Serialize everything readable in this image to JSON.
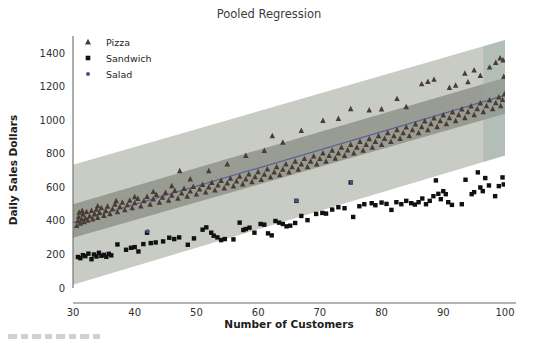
{
  "figure": {
    "caption_fragment": "FIGURE 1"
  },
  "chart_data": {
    "type": "scatter",
    "title": "Pooled Regression",
    "xlabel": "Number of Customers",
    "ylabel": "Daily Sales Dollars",
    "xlim": [
      30,
      100
    ],
    "ylim": [
      0,
      1480
    ],
    "xticks": [
      30,
      40,
      50,
      60,
      70,
      80,
      90,
      100
    ],
    "yticks": [
      0,
      200,
      400,
      600,
      800,
      1000,
      1200,
      1400
    ],
    "grid": false,
    "legend_position": "upper-left",
    "legend": [
      {
        "label": "Pizza",
        "marker": "triangle",
        "color": "#4a3c33"
      },
      {
        "label": "Sandwich",
        "marker": "square",
        "color": "#111111"
      },
      {
        "label": "Salad",
        "marker": "dot",
        "color": "#4a4f8c"
      }
    ],
    "regression_line": {
      "name": "Pooled fit",
      "color": "#5b5f99",
      "x": [
        30,
        100
      ],
      "y": [
        390,
        1150
      ],
      "slope": 10.86,
      "intercept": 64.3
    },
    "bands": [
      {
        "name": "prediction-interval",
        "color": "#9aa396",
        "opacity": 0.55,
        "x": [
          30,
          100
        ],
        "upper": [
          735,
          1480
        ],
        "lower": [
          20,
          790
        ]
      },
      {
        "name": "confidence-interval",
        "color": "#5e6157",
        "opacity": 0.45,
        "x": [
          30,
          100
        ],
        "upper": [
          500,
          1255
        ],
        "lower": [
          300,
          1040
        ]
      }
    ],
    "band_right_tint": {
      "name": "right-edge-tint",
      "color": "#93a7a4",
      "x_start": 96.5,
      "x_end": 100
    },
    "series": [
      {
        "name": "Pizza",
        "marker": "triangle",
        "color": "#4a3c33",
        "points": [
          [
            30.6,
            372
          ],
          [
            30.8,
            400
          ],
          [
            30.9,
            425
          ],
          [
            31.0,
            452
          ],
          [
            31.2,
            386
          ],
          [
            31.4,
            410
          ],
          [
            31.6,
            440
          ],
          [
            31.8,
            395
          ],
          [
            32.0,
            418
          ],
          [
            32.2,
            455
          ],
          [
            32.4,
            404
          ],
          [
            32.7,
            430
          ],
          [
            33.0,
            462
          ],
          [
            33.2,
            412
          ],
          [
            33.5,
            443
          ],
          [
            33.8,
            470
          ],
          [
            34.0,
            421
          ],
          [
            34.3,
            450
          ],
          [
            34.6,
            478
          ],
          [
            35.0,
            432
          ],
          [
            35.3,
            462
          ],
          [
            35.6,
            488
          ],
          [
            36.0,
            443
          ],
          [
            36.4,
            472
          ],
          [
            36.8,
            500
          ],
          [
            37.2,
            455
          ],
          [
            37.6,
            485
          ],
          [
            38.0,
            512
          ],
          [
            38.4,
            466
          ],
          [
            38.8,
            496
          ],
          [
            39.2,
            523
          ],
          [
            39.6,
            478
          ],
          [
            40.0,
            508
          ],
          [
            40.5,
            534
          ],
          [
            41.0,
            489
          ],
          [
            41.5,
            520
          ],
          [
            42.0,
            546
          ],
          [
            42.5,
            500
          ],
          [
            43.0,
            531
          ],
          [
            43.5,
            558
          ],
          [
            44.0,
            512
          ],
          [
            44.5,
            542
          ],
          [
            45.0,
            570
          ],
          [
            45.5,
            524
          ],
          [
            46.0,
            554
          ],
          [
            46.5,
            582
          ],
          [
            47.0,
            536
          ],
          [
            47.3,
            700
          ],
          [
            47.6,
            566
          ],
          [
            48.0,
            594
          ],
          [
            48.5,
            548
          ],
          [
            49.0,
            578
          ],
          [
            49.5,
            606
          ],
          [
            50.0,
            560
          ],
          [
            50.5,
            590
          ],
          [
            51.0,
            618
          ],
          [
            51.5,
            572
          ],
          [
            52.0,
            602
          ],
          [
            52.5,
            630
          ],
          [
            53.0,
            584
          ],
          [
            53.5,
            614
          ],
          [
            54.0,
            642
          ],
          [
            54.5,
            596
          ],
          [
            55.0,
            626
          ],
          [
            55.5,
            654
          ],
          [
            56.0,
            608
          ],
          [
            56.5,
            638
          ],
          [
            57.0,
            666
          ],
          [
            57.5,
            620
          ],
          [
            58.0,
            650
          ],
          [
            58.5,
            680
          ],
          [
            59.0,
            634
          ],
          [
            59.5,
            664
          ],
          [
            60.0,
            694
          ],
          [
            60.5,
            648
          ],
          [
            61.0,
            678
          ],
          [
            61.5,
            710
          ],
          [
            62.0,
            662
          ],
          [
            62.3,
            908
          ],
          [
            62.6,
            692
          ],
          [
            63.0,
            724
          ],
          [
            63.5,
            676
          ],
          [
            64.0,
            708
          ],
          [
            64.5,
            740
          ],
          [
            65.0,
            692
          ],
          [
            65.5,
            724
          ],
          [
            66.0,
            756
          ],
          [
            66.5,
            708
          ],
          [
            67.0,
            740
          ],
          [
            67.5,
            772
          ],
          [
            68.0,
            724
          ],
          [
            68.5,
            756
          ],
          [
            69.0,
            788
          ],
          [
            69.5,
            740
          ],
          [
            70.0,
            772
          ],
          [
            70.5,
            806
          ],
          [
            71.0,
            756
          ],
          [
            71.5,
            790
          ],
          [
            72.0,
            822
          ],
          [
            72.5,
            774
          ],
          [
            73.0,
            806
          ],
          [
            73.5,
            840
          ],
          [
            74.0,
            790
          ],
          [
            74.5,
            824
          ],
          [
            75.0,
            856
          ],
          [
            75.5,
            806
          ],
          [
            76.0,
            840
          ],
          [
            76.5,
            874
          ],
          [
            77.0,
            822
          ],
          [
            77.5,
            856
          ],
          [
            78.0,
            890
          ],
          [
            78.5,
            840
          ],
          [
            79.0,
            874
          ],
          [
            79.5,
            908
          ],
          [
            80.0,
            856
          ],
          [
            80.5,
            892
          ],
          [
            81.0,
            926
          ],
          [
            81.5,
            874
          ],
          [
            82.0,
            908
          ],
          [
            82.5,
            944
          ],
          [
            83.0,
            892
          ],
          [
            83.5,
            926
          ],
          [
            84.0,
            960
          ],
          [
            84.5,
            908
          ],
          [
            85.0,
            944
          ],
          [
            85.5,
            978
          ],
          [
            86.0,
            926
          ],
          [
            86.5,
            962
          ],
          [
            87.0,
            996
          ],
          [
            87.5,
            944
          ],
          [
            88.0,
            980
          ],
          [
            88.5,
            1014
          ],
          [
            89.0,
            962
          ],
          [
            89.5,
            998
          ],
          [
            90.0,
            1032
          ],
          [
            90.5,
            980
          ],
          [
            91.0,
            1016
          ],
          [
            91.5,
            1050
          ],
          [
            92.0,
            998
          ],
          [
            92.5,
            1034
          ],
          [
            93.0,
            1068
          ],
          [
            93.5,
            1016
          ],
          [
            94.0,
            1052
          ],
          [
            94.5,
            1086
          ],
          [
            95.0,
            1034
          ],
          [
            95.5,
            1070
          ],
          [
            96.0,
            1104
          ],
          [
            96.5,
            1052
          ],
          [
            97.0,
            1088
          ],
          [
            97.5,
            1122
          ],
          [
            98.0,
            1070
          ],
          [
            98.5,
            1106
          ],
          [
            99.0,
            1140
          ],
          [
            99.3,
            1088
          ],
          [
            99.6,
            1124
          ],
          [
            99.9,
            1158
          ],
          [
            86.5,
            1218
          ],
          [
            87.5,
            1232
          ],
          [
            88.5,
            1245
          ],
          [
            93.5,
            1282
          ],
          [
            95.0,
            1300
          ],
          [
            96.0,
            1268
          ],
          [
            97.5,
            1318
          ],
          [
            98.5,
            1345
          ],
          [
            99.2,
            1372
          ],
          [
            99.7,
            1360
          ],
          [
            99.8,
            1262
          ],
          [
            91.0,
            1196
          ],
          [
            92.0,
            1210
          ],
          [
            94.0,
            1230
          ],
          [
            82.5,
            1130
          ],
          [
            84.0,
            1082
          ],
          [
            80.0,
            1068
          ],
          [
            78.0,
            1062
          ],
          [
            75.0,
            1070
          ],
          [
            70.5,
            1000
          ],
          [
            73.0,
            1012
          ],
          [
            67.0,
            940
          ],
          [
            64.0,
            870
          ],
          [
            61.0,
            820
          ],
          [
            58.0,
            790
          ],
          [
            55.0,
            740
          ],
          [
            52.0,
            700
          ],
          [
            49.0,
            650
          ],
          [
            46.0,
            610
          ],
          [
            43.0,
            575
          ],
          [
            40.0,
            545
          ],
          [
            37.0,
            520
          ],
          [
            34.0,
            490
          ],
          [
            31.5,
            462
          ]
        ]
      },
      {
        "name": "Sandwich",
        "marker": "square",
        "color": "#111111",
        "points": [
          [
            30.8,
            185
          ],
          [
            31.2,
            178
          ],
          [
            31.6,
            196
          ],
          [
            32.0,
            190
          ],
          [
            32.5,
            205
          ],
          [
            33.0,
            172
          ],
          [
            33.4,
            200
          ],
          [
            33.8,
            188
          ],
          [
            34.2,
            210
          ],
          [
            34.6,
            192
          ],
          [
            35.0,
            198
          ],
          [
            35.4,
            186
          ],
          [
            35.8,
            204
          ],
          [
            36.2,
            195
          ],
          [
            37.2,
            260
          ],
          [
            38.6,
            228
          ],
          [
            39.4,
            240
          ],
          [
            40.0,
            244
          ],
          [
            40.6,
            218
          ],
          [
            41.4,
            262
          ],
          [
            42.0,
            330
          ],
          [
            42.6,
            268
          ],
          [
            43.4,
            272
          ],
          [
            44.6,
            278
          ],
          [
            45.6,
            300
          ],
          [
            46.4,
            292
          ],
          [
            47.2,
            302
          ],
          [
            48.6,
            258
          ],
          [
            49.6,
            296
          ],
          [
            51.0,
            348
          ],
          [
            51.6,
            362
          ],
          [
            52.4,
            330
          ],
          [
            52.8,
            312
          ],
          [
            53.4,
            302
          ],
          [
            54.0,
            286
          ],
          [
            54.6,
            292
          ],
          [
            56.0,
            290
          ],
          [
            57.0,
            390
          ],
          [
            57.6,
            346
          ],
          [
            58.0,
            352
          ],
          [
            58.6,
            360
          ],
          [
            59.4,
            330
          ],
          [
            60.4,
            382
          ],
          [
            61.0,
            378
          ],
          [
            61.6,
            326
          ],
          [
            62.2,
            314
          ],
          [
            62.8,
            400
          ],
          [
            63.4,
            390
          ],
          [
            64.0,
            382
          ],
          [
            64.6,
            368
          ],
          [
            65.2,
            372
          ],
          [
            66.0,
            388
          ],
          [
            66.2,
            520
          ],
          [
            67.0,
            430
          ],
          [
            68.0,
            405
          ],
          [
            69.4,
            442
          ],
          [
            70.4,
            448
          ],
          [
            71.0,
            444
          ],
          [
            72.0,
            468
          ],
          [
            73.0,
            482
          ],
          [
            74.0,
            476
          ],
          [
            75.0,
            630
          ],
          [
            75.4,
            424
          ],
          [
            76.4,
            488
          ],
          [
            77.2,
            500
          ],
          [
            78.4,
            506
          ],
          [
            79.0,
            494
          ],
          [
            80.0,
            510
          ],
          [
            80.8,
            502
          ],
          [
            81.6,
            466
          ],
          [
            82.4,
            512
          ],
          [
            83.2,
            500
          ],
          [
            84.0,
            520
          ],
          [
            84.8,
            506
          ],
          [
            85.4,
            498
          ],
          [
            86.0,
            512
          ],
          [
            86.6,
            534
          ],
          [
            87.2,
            500
          ],
          [
            87.8,
            520
          ],
          [
            88.4,
            548
          ],
          [
            88.8,
            642
          ],
          [
            89.2,
            562
          ],
          [
            89.6,
            530
          ],
          [
            90.0,
            578
          ],
          [
            90.4,
            560
          ],
          [
            90.8,
            512
          ],
          [
            91.4,
            496
          ],
          [
            93.0,
            500
          ],
          [
            93.6,
            646
          ],
          [
            94.6,
            560
          ],
          [
            95.0,
            572
          ],
          [
            95.6,
            690
          ],
          [
            96.0,
            600
          ],
          [
            96.4,
            578
          ],
          [
            96.8,
            656
          ],
          [
            97.4,
            612
          ],
          [
            98.4,
            548
          ],
          [
            99.0,
            608
          ],
          [
            99.6,
            660
          ],
          [
            99.8,
            618
          ]
        ]
      },
      {
        "name": "Salad",
        "marker": "dot",
        "color": "#4a4f8c",
        "points": [
          [
            42.1,
            338
          ],
          [
            66.2,
            520
          ],
          [
            75.1,
            632
          ]
        ]
      }
    ]
  }
}
